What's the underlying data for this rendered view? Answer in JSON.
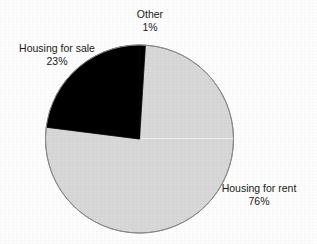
{
  "chart_data": {
    "type": "pie",
    "title": "",
    "subtitle": "",
    "xlabel": "",
    "ylabel": "",
    "legend_position": "none",
    "grid": false,
    "labels_inline": true,
    "start_angle_deg": 0,
    "direction": "clockwise",
    "categories": [
      "Other",
      "Housing for rent",
      "Housing for sale"
    ],
    "values": [
      1,
      76,
      23
    ],
    "unit": "%",
    "slices": [
      {
        "name": "Other",
        "label": "Other",
        "value": 1,
        "value_text": "1%",
        "color": "#000000",
        "start_deg": 0,
        "end_deg": 3.6,
        "label_position": "top-center"
      },
      {
        "name": "Housing for rent",
        "label": "Housing for rent",
        "value": 76,
        "value_text": "76%",
        "color": "#d8d8d8",
        "start_deg": 3.6,
        "end_deg": 277.2,
        "label_position": "right-bottom"
      },
      {
        "name": "Housing for sale",
        "label": "Housing for sale",
        "value": 23,
        "value_text": "23%",
        "color": "#000000",
        "start_deg": 277.2,
        "end_deg": 360,
        "label_position": "left-top"
      }
    ]
  },
  "labels": {
    "other": {
      "name": "Other",
      "percent": "1%"
    },
    "sale": {
      "name": "Housing for sale",
      "percent": "23%"
    },
    "rent": {
      "name": "Housing for rent",
      "percent": "76%"
    }
  },
  "colors": {
    "slice_dark": "#000000",
    "slice_light": "#d8d8d8",
    "outline": "#8a8a8a",
    "background": "#fdfdfd",
    "text": "#1a1a1a"
  }
}
